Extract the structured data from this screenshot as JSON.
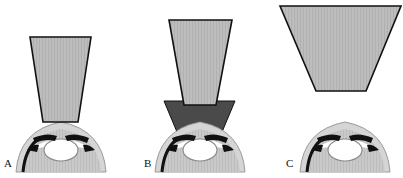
{
  "figure": {
    "panels": [
      {
        "id": "A",
        "label": "A",
        "description": "Single light-gray tapered beam resting on corneal surface"
      },
      {
        "id": "B",
        "label": "B",
        "description": "Light-gray tapered beam stacked on a dark-gray tapered spacer over the cornea"
      },
      {
        "id": "C",
        "label": "C",
        "description": "Wide light-gray tapered beam positioned well above the cornea"
      }
    ],
    "colors": {
      "beam_fill": "#b9b9b9",
      "spacer_fill": "#4a4a4a",
      "outline": "#111111",
      "eye_fill": "#c4c4c4",
      "cornea_fill": "#d8d8d8",
      "lens_fill": "#ffffff"
    }
  }
}
